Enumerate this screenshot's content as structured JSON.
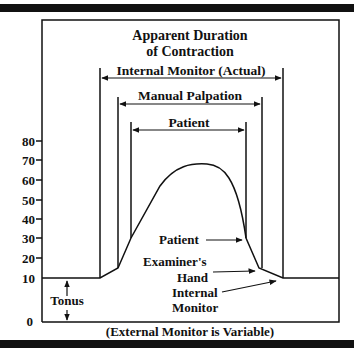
{
  "title_line1": "Apparent Duration",
  "title_line2": "of Contraction",
  "spans": {
    "internal": "Internal Monitor (Actual)",
    "manual": "Manual Palpation",
    "patient": "Patient"
  },
  "y_axis": {
    "ticks": [
      "80",
      "70",
      "60",
      "50",
      "40",
      "30",
      "20",
      "10",
      "0"
    ]
  },
  "annotations": {
    "patient": "Patient",
    "examiner_line1": "Examiner's",
    "examiner_line2": "Hand",
    "internal_line1": "Internal",
    "internal_line2": "Monitor",
    "tonus": "Tonus"
  },
  "footer": "(External Monitor is Variable)",
  "colors": {
    "ink": "#111111",
    "background": "#ffffff"
  }
}
